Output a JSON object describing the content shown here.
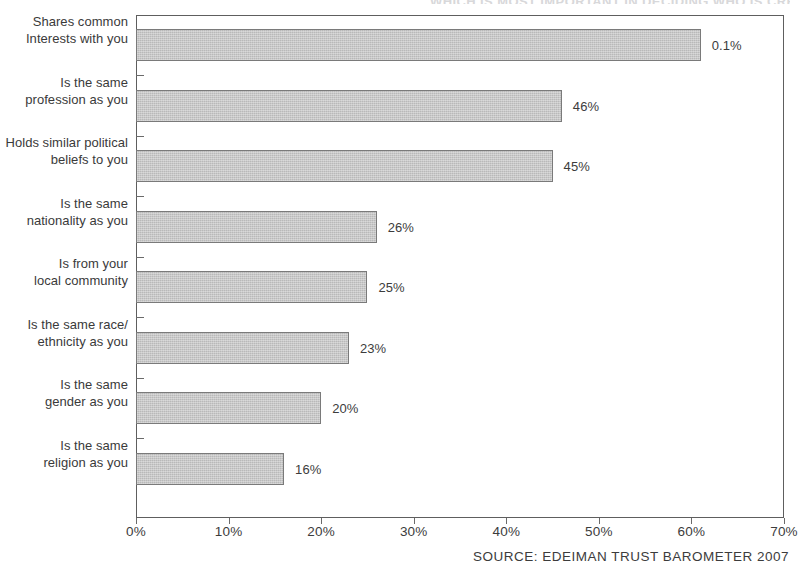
{
  "chart_data": {
    "type": "bar",
    "orientation": "horizontal",
    "title": "WHICH IS MOST IMPORTANT IN DECIDING WHO IS CREDIBLE?",
    "categories": [
      "Shares common\nInterests with you",
      "Is the same\nprofession as you",
      "Holds similar political\nbeliefs to you",
      "Is the same\nnationality as you",
      "Is from your\nlocal community",
      "Is the same race/\nethnicity as you",
      "Is the same\ngender as you",
      "Is the same\nreligion as you"
    ],
    "values": [
      61,
      46,
      45,
      26,
      25,
      23,
      20,
      16
    ],
    "value_labels": [
      "0.1%",
      "46%",
      "45%",
      "26%",
      "25%",
      "23%",
      "20%",
      "16%"
    ],
    "xlabel": "",
    "ylabel": "",
    "xlim": [
      0,
      70
    ],
    "xtick_labels": [
      "0%",
      "10%",
      "20%",
      "30%",
      "40%",
      "50%",
      "60%",
      "70%"
    ],
    "xticks": [
      0,
      10,
      20,
      30,
      40,
      50,
      60,
      70
    ],
    "grid": false,
    "legend": null,
    "bar_color": "#b9b9b9",
    "bar_border_color": "#7a7a7a",
    "axis_color": "#5e5e5e",
    "text_color": "#3a3a3a"
  },
  "source": {
    "text": "SOURCE: EDEIMAN TRUST BAROMETER 2007"
  }
}
